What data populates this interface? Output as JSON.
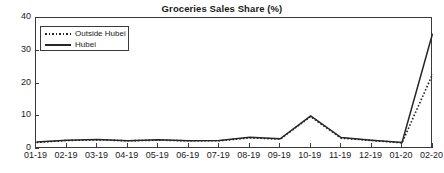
{
  "chart_data": {
    "type": "line",
    "title": "Groceries Sales Share (%)",
    "xlabel": "",
    "ylabel": "",
    "ylim": [
      0,
      40
    ],
    "yticks": [
      0,
      10,
      20,
      30,
      40
    ],
    "ytick_labels": [
      "0",
      "10",
      "20",
      "30",
      "40"
    ],
    "grid": false,
    "legend_position": "upper left",
    "categories": [
      "01-19",
      "02-19",
      "03-19",
      "04-19",
      "05-19",
      "06-19",
      "07-19",
      "08-19",
      "09-19",
      "10-19",
      "11-19",
      "12-19",
      "01-20",
      "02-20"
    ],
    "series": [
      {
        "name": "Outside Hubei",
        "style": "dotted",
        "color": "#262626",
        "values": [
          2.0,
          2.6,
          2.8,
          2.5,
          2.7,
          2.5,
          2.5,
          3.4,
          3.0,
          9.9,
          3.3,
          2.6,
          1.9,
          22.8
        ]
      },
      {
        "name": "Hubei",
        "style": "solid",
        "color": "#262626",
        "values": [
          2.1,
          2.7,
          2.9,
          2.5,
          2.8,
          2.5,
          2.6,
          3.6,
          3.1,
          10.1,
          3.5,
          2.7,
          2.0,
          35.2
        ]
      }
    ]
  },
  "legend": {
    "items": [
      {
        "label": "Outside Hubei",
        "style": "dotted"
      },
      {
        "label": "Hubei",
        "style": "solid"
      }
    ]
  },
  "colors": {
    "axis": "#3a3a3a",
    "line": "#262626",
    "background": "#ffffff",
    "text": "#1a1a1a"
  }
}
